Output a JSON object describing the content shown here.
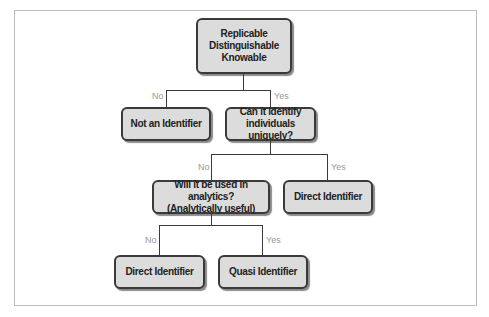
{
  "diagram": {
    "root": {
      "lines": [
        "Replicable",
        "Distinguishable",
        "Knowable"
      ]
    },
    "branch1": {
      "no_label": "No",
      "yes_label": "Yes"
    },
    "not_identifier": {
      "label": "Not an Identifier"
    },
    "identify_uniquely": {
      "lines": [
        "Can it identify",
        "individuals uniquely?"
      ]
    },
    "branch2": {
      "no_label": "No",
      "yes_label": "Yes"
    },
    "analytics": {
      "lines": [
        "Will it be used in analytics?",
        "(Analytically useful)"
      ]
    },
    "direct_identifier_1": {
      "label": "Direct Identifier"
    },
    "branch3": {
      "no_label": "No",
      "yes_label": "Yes"
    },
    "direct_identifier_2": {
      "label": "Direct Identifier"
    },
    "quasi_identifier": {
      "label": "Quasi Identifier"
    }
  }
}
